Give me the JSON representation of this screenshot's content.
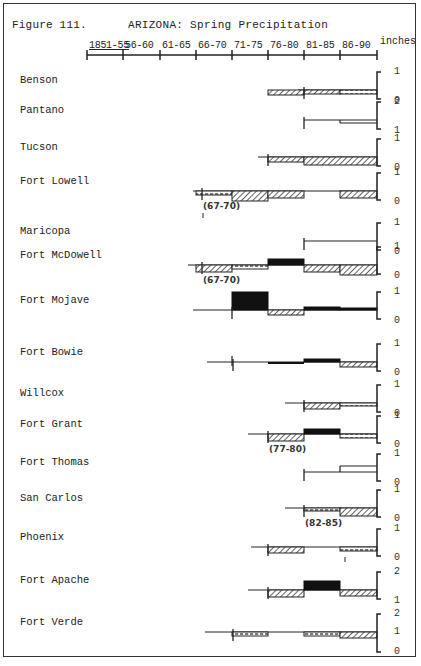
{
  "figure": {
    "number_label": "Figure 111.",
    "title": "ARIZONA:  Spring Precipitation",
    "units_label": "inches"
  },
  "axis": {
    "periods": [
      "1851-55",
      "56-60",
      "61-65",
      "66-70",
      "71-75",
      "76-80",
      "81-85",
      "86-90"
    ],
    "tick_x": [
      87,
      123,
      160,
      196,
      232,
      268,
      304,
      340,
      377
    ]
  },
  "legend_styles": {
    "surplus": {
      "fill": "#111111",
      "description": "solid black above baseline"
    },
    "deficit": {
      "fill": "hatch-diagonal",
      "description": "diagonal hatch below baseline"
    },
    "small_deficit": {
      "fill": "hatch-dashed",
      "description": "light dashed hatch below baseline"
    }
  },
  "stations": [
    {
      "name": "Benson",
      "y": 90,
      "scale": [
        "1",
        "0"
      ],
      "line_start": 298,
      "segments": [
        {
          "from": 5,
          "to": 6,
          "kind": "deficit",
          "depth": 5
        },
        {
          "from": 6,
          "to": 7,
          "kind": "deficit",
          "depth": 4
        },
        {
          "from": 7,
          "to": 8,
          "kind": "small_deficit",
          "depth": 4
        }
      ],
      "start_tick": 304
    },
    {
      "name": "Pantano",
      "y": 120,
      "scale": [
        "2",
        "1"
      ],
      "line_start": 304,
      "segments": [
        {
          "from": 6,
          "to": 7,
          "kind": "line",
          "depth": 0
        },
        {
          "from": 7,
          "to": 8,
          "kind": "line",
          "depth": 3
        }
      ],
      "start_tick": 304
    },
    {
      "name": "Tucson",
      "y": 157,
      "scale": [
        "1",
        "0"
      ],
      "line_start": 258,
      "segments": [
        {
          "from": 5,
          "to": 6,
          "kind": "deficit",
          "depth": 5
        },
        {
          "from": 6,
          "to": 8,
          "kind": "deficit",
          "depth": 8
        }
      ],
      "start_tick": 268
    },
    {
      "name": "Fort Lowell",
      "y": 191,
      "scale": [
        "1",
        "0"
      ],
      "line_start": 193,
      "segments": [
        {
          "from": 3,
          "to": 4,
          "kind": "small_deficit",
          "depth": 4
        },
        {
          "from": 4,
          "to": 5,
          "kind": "deficit",
          "depth": 10
        },
        {
          "from": 5,
          "to": 6,
          "kind": "deficit",
          "depth": 7
        },
        {
          "from": 7,
          "to": 8,
          "kind": "deficit",
          "depth": 7
        }
      ],
      "start_tick": 202,
      "annotation": "(67-70)"
    },
    {
      "name": "Maricopa",
      "y": 241,
      "scale": [
        "1",
        "0"
      ],
      "line_start": 304,
      "segments": [
        {
          "from": 6,
          "to": 8,
          "kind": "line",
          "depth": 0
        }
      ],
      "start_tick": 304
    },
    {
      "name": "Fort McDowell",
      "y": 265,
      "scale": [
        "1",
        "0"
      ],
      "line_start": 188,
      "segments": [
        {
          "from": 3,
          "to": 4,
          "kind": "deficit",
          "depth": 7
        },
        {
          "from": 4,
          "to": 5,
          "kind": "small_deficit",
          "depth": 4
        },
        {
          "from": 5,
          "to": 6,
          "kind": "surplus",
          "height": 6
        },
        {
          "from": 6,
          "to": 7,
          "kind": "deficit",
          "depth": 7
        },
        {
          "from": 7,
          "to": 8,
          "kind": "deficit",
          "depth": 10
        }
      ],
      "start_tick": 202,
      "annotation": "(67-70)"
    },
    {
      "name": "Fort Mojave",
      "y": 310,
      "scale": [
        "1",
        "0"
      ],
      "line_start": 193,
      "segments": [
        {
          "from": 4,
          "to": 5,
          "kind": "surplus",
          "height": 18
        },
        {
          "from": 5,
          "to": 6,
          "kind": "deficit",
          "depth": 5
        },
        {
          "from": 6,
          "to": 7,
          "kind": "surplus",
          "height": 3
        },
        {
          "from": 7,
          "to": 8,
          "kind": "surplus",
          "height": 2
        }
      ],
      "start_tick": 232
    },
    {
      "name": "Fort Bowie",
      "y": 362,
      "scale": [
        "1",
        "0"
      ],
      "line_start": 207,
      "segments": [
        {
          "from": 5,
          "to": 6,
          "kind": "deficit_solid",
          "depth": 2
        },
        {
          "from": 6,
          "to": 7,
          "kind": "surplus",
          "height": 3
        },
        {
          "from": 7,
          "to": 8,
          "kind": "deficit",
          "depth": 5
        }
      ],
      "start_tick": 233
    },
    {
      "name": "Willcox",
      "y": 403,
      "scale": [
        "1",
        "0"
      ],
      "line_start": 285,
      "segments": [
        {
          "from": 6,
          "to": 7,
          "kind": "deficit",
          "depth": 6
        },
        {
          "from": 7,
          "to": 8,
          "kind": "small_deficit",
          "depth": 3
        }
      ],
      "start_tick": 304
    },
    {
      "name": "Fort Grant",
      "y": 434,
      "scale": [
        "1",
        "0"
      ],
      "line_start": 248,
      "segments": [
        {
          "from": 5,
          "to": 6,
          "kind": "deficit",
          "depth": 7
        },
        {
          "from": 6,
          "to": 7,
          "kind": "surplus",
          "height": 5
        },
        {
          "from": 7,
          "to": 8,
          "kind": "small_deficit",
          "depth": 4
        }
      ],
      "start_tick": 268,
      "annotation": "(77-80)"
    },
    {
      "name": "Fort Thomas",
      "y": 472,
      "scale": [
        "1",
        "0"
      ],
      "line_start": 304,
      "segments": [
        {
          "from": 6,
          "to": 7,
          "kind": "line",
          "depth": 0
        },
        {
          "from": 7,
          "to": 8,
          "kind": "line_up",
          "height": 6
        }
      ],
      "start_tick": 304
    },
    {
      "name": "San Carlos",
      "y": 508,
      "scale": [
        "1",
        "0"
      ],
      "line_start": 285,
      "segments": [
        {
          "from": 6,
          "to": 7,
          "kind": "small_deficit",
          "depth": 3
        },
        {
          "from": 7,
          "to": 8,
          "kind": "deficit",
          "depth": 8
        }
      ],
      "start_tick": 304,
      "annotation": "(82-85)"
    },
    {
      "name": "Phoenix",
      "y": 547,
      "scale": [
        "1",
        "0"
      ],
      "line_start": 251,
      "segments": [
        {
          "from": 5,
          "to": 6,
          "kind": "deficit",
          "depth": 6
        },
        {
          "from": 7,
          "to": 8,
          "kind": "small_deficit",
          "depth": 4
        }
      ],
      "start_tick": 268
    },
    {
      "name": "Fort Apache",
      "y": 590,
      "scale": [
        "2",
        "1"
      ],
      "line_start": 248,
      "segments": [
        {
          "from": 5,
          "to": 6,
          "kind": "deficit",
          "depth": 7
        },
        {
          "from": 6,
          "to": 7,
          "kind": "surplus",
          "height": 9
        },
        {
          "from": 7,
          "to": 8,
          "kind": "deficit",
          "depth": 6
        }
      ],
      "start_tick": 268
    },
    {
      "name": "Fort Verde",
      "y": 632,
      "scale": [
        "2",
        "1",
        "0"
      ],
      "line_start": 205,
      "segments": [
        {
          "from": 4,
          "to": 5,
          "kind": "small_deficit",
          "depth": 4
        },
        {
          "from": 6,
          "to": 7,
          "kind": "small_deficit",
          "depth": 4
        },
        {
          "from": 7,
          "to": 8,
          "kind": "deficit",
          "depth": 6
        }
      ],
      "start_tick": 233
    }
  ],
  "chart_data": {
    "type": "bar",
    "title": "ARIZONA: Spring Precipitation",
    "subtitle": "Figure 111.",
    "xlabel": "Period",
    "ylabel": "inches (deviation per station, step chart)",
    "categories": [
      "1851-55",
      "56-60",
      "61-65",
      "66-70",
      "71-75",
      "76-80",
      "81-85",
      "86-90"
    ],
    "legend": [
      "surplus (solid black)",
      "deficit (diagonal hatch)",
      "small deficit (dashed hatch)"
    ],
    "series": [
      {
        "name": "Benson",
        "values": [
          null,
          null,
          null,
          null,
          null,
          -0.4,
          -0.3,
          -0.3
        ]
      },
      {
        "name": "Pantano",
        "values": [
          null,
          null,
          null,
          null,
          null,
          null,
          0.0,
          -0.3
        ]
      },
      {
        "name": "Tucson",
        "values": [
          null,
          null,
          null,
          null,
          null,
          -0.4,
          -0.7,
          -0.7
        ]
      },
      {
        "name": "Fort Lowell",
        "values": [
          null,
          null,
          null,
          -0.3,
          -0.8,
          -0.6,
          null,
          -0.6
        ]
      },
      {
        "name": "Maricopa",
        "values": [
          null,
          null,
          null,
          null,
          null,
          null,
          0.0,
          0.0
        ]
      },
      {
        "name": "Fort McDowell",
        "values": [
          null,
          null,
          null,
          -0.6,
          -0.3,
          0.5,
          -0.6,
          -0.8
        ]
      },
      {
        "name": "Fort Mojave",
        "values": [
          null,
          null,
          null,
          null,
          1.4,
          -0.4,
          0.3,
          0.2
        ]
      },
      {
        "name": "Fort Bowie",
        "values": [
          null,
          null,
          null,
          null,
          null,
          -0.2,
          0.2,
          -0.4
        ]
      },
      {
        "name": "Willcox",
        "values": [
          null,
          null,
          null,
          null,
          null,
          null,
          -0.5,
          -0.2
        ]
      },
      {
        "name": "Fort Grant",
        "values": [
          null,
          null,
          null,
          null,
          null,
          -0.6,
          0.4,
          -0.3
        ]
      },
      {
        "name": "Fort Thomas",
        "values": [
          null,
          null,
          null,
          null,
          null,
          null,
          0.0,
          0.5
        ]
      },
      {
        "name": "San Carlos",
        "values": [
          null,
          null,
          null,
          null,
          null,
          null,
          -0.2,
          -0.6
        ]
      },
      {
        "name": "Phoenix",
        "values": [
          null,
          null,
          null,
          null,
          null,
          -0.5,
          null,
          -0.3
        ]
      },
      {
        "name": "Fort Apache",
        "values": [
          null,
          null,
          null,
          null,
          null,
          -0.6,
          0.7,
          -0.5
        ]
      },
      {
        "name": "Fort Verde",
        "values": [
          null,
          null,
          null,
          null,
          -0.3,
          null,
          -0.3,
          -0.5
        ]
      }
    ],
    "annotations": [
      {
        "station": "Fort Lowell",
        "text": "(67-70)"
      },
      {
        "station": "Fort McDowell",
        "text": "(67-70)"
      },
      {
        "station": "Fort Grant",
        "text": "(77-80)"
      },
      {
        "station": "San Carlos",
        "text": "(82-85)"
      }
    ],
    "grid": false
  }
}
